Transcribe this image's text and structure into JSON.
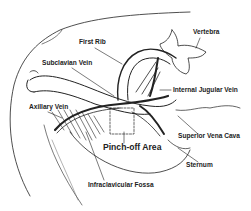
{
  "diagram": {
    "labels": {
      "vertebra": "Vertebra",
      "first_rib": "First Rib",
      "subclavian_vein": "Subclavian Vein",
      "internal_jugular_vein": "Internal Jugular Vein",
      "axillary_vein": "Axillary Vein",
      "superior_vena_cava": "Superior Vena Cava",
      "pinch_off_area": "Pinch-off Area",
      "sternum": "Sternum",
      "infraclavicular_fossa": "Infraclavicular Fossa"
    },
    "colors": {
      "line": "#222222",
      "background": "#ffffff"
    }
  }
}
